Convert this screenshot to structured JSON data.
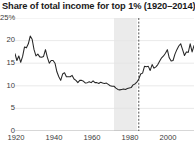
{
  "chart_data": {
    "type": "line",
    "title": "Share of total income for top 1% (1920–2014)",
    "xlabel": "",
    "ylabel": "",
    "ylim": [
      0,
      25
    ],
    "xlim": [
      1920,
      2014
    ],
    "grid": true,
    "legend_position": "none",
    "y_ticks": [
      {
        "value": 25,
        "label": "25%"
      },
      {
        "value": 20,
        "label": "20"
      },
      {
        "value": 15,
        "label": "15"
      },
      {
        "value": 10,
        "label": "10"
      },
      {
        "value": 5,
        "label": "5"
      },
      {
        "value": 0,
        "label": "0"
      }
    ],
    "x_ticks": [
      {
        "value": 1920,
        "label": "1920"
      },
      {
        "value": 1940,
        "label": "1940"
      },
      {
        "value": 1960,
        "label": "1960"
      },
      {
        "value": 1980,
        "label": "1980"
      },
      {
        "value": 2000,
        "label": "2000"
      }
    ],
    "annotations": {
      "shaded_band": {
        "x_start": 1972,
        "x_end": 1984,
        "color": "#ebebeb"
      },
      "dashed_vline": {
        "x": 1985,
        "color": "#555555"
      }
    },
    "line_color": "#262626",
    "x": [
      1920,
      1921,
      1922,
      1923,
      1924,
      1925,
      1926,
      1927,
      1928,
      1929,
      1930,
      1931,
      1932,
      1933,
      1934,
      1935,
      1936,
      1937,
      1938,
      1939,
      1940,
      1941,
      1942,
      1943,
      1944,
      1945,
      1946,
      1947,
      1948,
      1949,
      1950,
      1951,
      1952,
      1953,
      1954,
      1955,
      1956,
      1957,
      1958,
      1959,
      1960,
      1961,
      1962,
      1963,
      1964,
      1965,
      1966,
      1967,
      1968,
      1969,
      1970,
      1971,
      1972,
      1973,
      1974,
      1975,
      1976,
      1977,
      1978,
      1979,
      1980,
      1981,
      1982,
      1983,
      1984,
      1985,
      1986,
      1987,
      1988,
      1989,
      1990,
      1991,
      1992,
      1993,
      1994,
      1995,
      1996,
      1997,
      1998,
      1999,
      2000,
      2001,
      2002,
      2003,
      2004,
      2005,
      2006,
      2007,
      2008,
      2009,
      2010,
      2011,
      2012,
      2013,
      2014
    ],
    "values": [
      17.1,
      15.6,
      16.6,
      15.2,
      16.5,
      18.6,
      18.4,
      19.3,
      21.0,
      20.3,
      18.0,
      16.6,
      17.0,
      16.4,
      16.3,
      16.5,
      18.0,
      16.3,
      15.0,
      15.6,
      15.6,
      15.0,
      13.1,
      12.0,
      11.2,
      12.6,
      12.9,
      12.0,
      12.0,
      12.0,
      12.3,
      11.5,
      11.2,
      10.7,
      11.2,
      11.2,
      11.0,
      10.6,
      10.7,
      10.9,
      10.7,
      11.1,
      10.7,
      10.7,
      10.5,
      10.8,
      10.6,
      10.5,
      10.6,
      10.3,
      10.0,
      9.9,
      9.9,
      9.5,
      9.2,
      9.1,
      9.2,
      9.3,
      9.2,
      9.4,
      9.5,
      9.6,
      10.2,
      10.4,
      10.8,
      11.5,
      12.6,
      12.8,
      14.3,
      14.2,
      14.3,
      13.4,
      14.7,
      13.9,
      14.2,
      14.7,
      15.5,
      16.2,
      16.6,
      17.2,
      18.0,
      16.2,
      15.5,
      15.6,
      17.0,
      18.0,
      18.8,
      19.3,
      18.0,
      16.7,
      17.5,
      17.4,
      19.3,
      17.5,
      18.9
    ]
  }
}
